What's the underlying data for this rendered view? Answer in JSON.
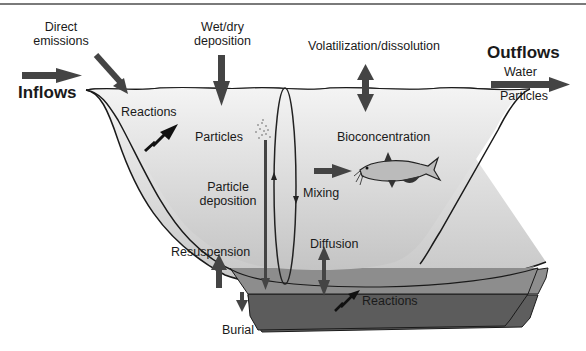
{
  "diagram": {
    "left": {
      "inflows": "Inflows",
      "direct_emissions_line1": "Direct",
      "direct_emissions_line2": "emissions"
    },
    "top": {
      "wet_dry_line1": "Wet/dry",
      "wet_dry_line2": "deposition",
      "volatilization": "Volatilization/dissolution"
    },
    "right": {
      "outflows": "Outflows",
      "water": "Water",
      "particles": "Particles"
    },
    "water_column": {
      "reactions": "Reactions",
      "particles": "Particles",
      "particle_deposition_line1": "Particle",
      "particle_deposition_line2": "deposition",
      "mixing": "Mixing",
      "bioconcentration": "Bioconcentration",
      "diffusion": "Diffusion",
      "resuspension": "Resuspension"
    },
    "sediment": {
      "reactions": "Reactions",
      "burial": "Burial"
    },
    "colors": {
      "water_top": "#f2f2f2",
      "water_bottom": "#c8c8c8",
      "sediment_upper": "#8c8c8c",
      "sediment_lower": "#5e5e5e",
      "arrow": "#444444",
      "outline": "#1a1a1a"
    }
  }
}
